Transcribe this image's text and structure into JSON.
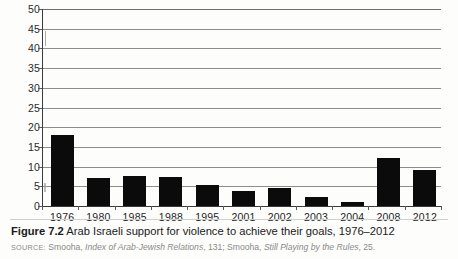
{
  "figure": {
    "number_label": "Figure 7.2",
    "caption_text": "Arab Israeli support for violence to achieve their goals, 1976–2012",
    "source_label": "SOURCE:",
    "source_part1": "Smooha,",
    "source_italic1": "Index of Arab-Jewish Relations",
    "source_part2": ", 131; Smooha,",
    "source_italic2": "Still Playing by the Rules",
    "source_part3": ", 25."
  },
  "chart_data": {
    "type": "bar",
    "title": "Arab Israeli support for violence to achieve their goals, 1976–2012",
    "xlabel": "",
    "ylabel": "",
    "categories": [
      "1976",
      "1980",
      "1985",
      "1988",
      "1995",
      "2001",
      "2002",
      "2003",
      "2004",
      "2008",
      "2012"
    ],
    "values": [
      18,
      7,
      7.5,
      7.3,
      5.4,
      3.8,
      4.6,
      2.2,
      1,
      12.2,
      9.2
    ],
    "ylim": [
      0,
      50
    ],
    "ytick_labels": [
      "50",
      "45",
      "40",
      "35",
      "30",
      "25",
      "20",
      "15",
      "10",
      "5",
      "0"
    ],
    "ytick_values": [
      50,
      45,
      40,
      35,
      30,
      25,
      20,
      15,
      10,
      5,
      0
    ],
    "grid": true,
    "legend": false,
    "bar_color": "#0b0b0b",
    "grid_color": "#8d8d8d",
    "axis_color": "#3a3a3a"
  }
}
